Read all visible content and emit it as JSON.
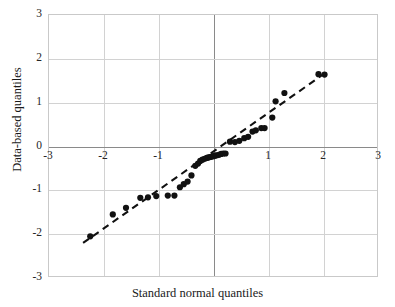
{
  "chart_data": {
    "type": "scatter",
    "title": "",
    "xlabel": "Standard normal quantiles",
    "ylabel": "Data-based quantiles",
    "xlim": [
      -3,
      3
    ],
    "ylim": [
      -3,
      3
    ],
    "xticks": [
      "-3",
      "-2",
      "-1",
      "0",
      "1",
      "2",
      "3"
    ],
    "xtick_values": [
      -3,
      -2,
      -1,
      0,
      1,
      2,
      3
    ],
    "xticks_visible": [
      "-3",
      "-2",
      "-1",
      "1",
      "2",
      "3"
    ],
    "yticks": [
      "-3",
      "-2",
      "-1",
      "0",
      "1",
      "2",
      "3"
    ],
    "ytick_values": [
      -3,
      -2,
      -1,
      0,
      1,
      2,
      3
    ],
    "grid": true,
    "legend": "none",
    "marker": "filled-circle",
    "marker_color": "#111111",
    "grid_color": "#d2d2d2",
    "axis_color": "#8a8a8a",
    "points": [
      [
        -2.25,
        -2.05
      ],
      [
        -1.84,
        -1.55
      ],
      [
        -1.6,
        -1.4
      ],
      [
        -1.34,
        -1.17
      ],
      [
        -1.2,
        -1.16
      ],
      [
        -1.05,
        -1.13
      ],
      [
        -0.84,
        -1.12
      ],
      [
        -0.72,
        -1.12
      ],
      [
        -0.62,
        -0.93
      ],
      [
        -0.55,
        -0.86
      ],
      [
        -0.48,
        -0.8
      ],
      [
        -0.41,
        -0.66
      ],
      [
        -0.34,
        -0.44
      ],
      [
        -0.29,
        -0.39
      ],
      [
        -0.25,
        -0.33
      ],
      [
        -0.21,
        -0.3
      ],
      [
        -0.17,
        -0.28
      ],
      [
        -0.13,
        -0.26
      ],
      [
        -0.1,
        -0.25
      ],
      [
        -0.07,
        -0.24
      ],
      [
        -0.04,
        -0.23
      ],
      [
        -0.01,
        -0.22
      ],
      [
        0.02,
        -0.21
      ],
      [
        0.05,
        -0.2
      ],
      [
        0.09,
        -0.19
      ],
      [
        0.13,
        -0.17
      ],
      [
        0.17,
        -0.16
      ],
      [
        0.21,
        -0.16
      ],
      [
        0.29,
        0.11
      ],
      [
        0.38,
        0.1
      ],
      [
        0.46,
        0.13
      ],
      [
        0.55,
        0.19
      ],
      [
        0.62,
        0.22
      ],
      [
        0.7,
        0.34
      ],
      [
        0.76,
        0.37
      ],
      [
        0.86,
        0.42
      ],
      [
        0.92,
        0.42
      ],
      [
        1.06,
        0.66
      ],
      [
        1.12,
        1.03
      ],
      [
        1.28,
        1.22
      ],
      [
        1.9,
        1.65
      ],
      [
        2.01,
        1.64
      ]
    ],
    "reference_line": {
      "style": "dashed",
      "color": "#111111",
      "x1": -2.38,
      "y1": -2.2,
      "x2": 2.06,
      "y2": 1.71
    },
    "annotations": []
  }
}
